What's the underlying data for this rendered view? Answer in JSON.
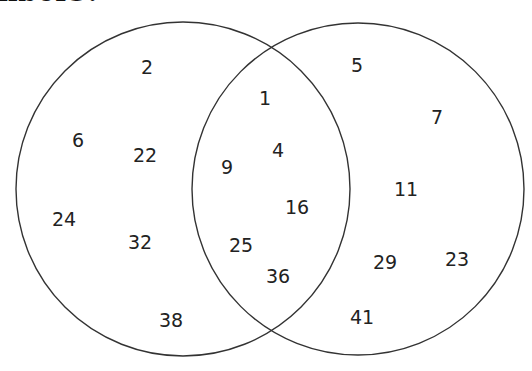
{
  "heading": {
    "text": "nbers?"
  },
  "diagram": {
    "type": "venn",
    "stroke_color": "#333333",
    "circles": [
      {
        "name": "left-set",
        "cx": 183,
        "cy": 189,
        "r": 167
      },
      {
        "name": "right-set",
        "cx": 358,
        "cy": 189,
        "r": 166
      }
    ],
    "regions": {
      "left_only": [
        {
          "value": "2",
          "x": 147,
          "y": 67
        },
        {
          "value": "6",
          "x": 78,
          "y": 140
        },
        {
          "value": "22",
          "x": 145,
          "y": 155
        },
        {
          "value": "24",
          "x": 64,
          "y": 219
        },
        {
          "value": "32",
          "x": 140,
          "y": 242
        },
        {
          "value": "38",
          "x": 171,
          "y": 320
        }
      ],
      "intersection": [
        {
          "value": "1",
          "x": 265,
          "y": 98
        },
        {
          "value": "4",
          "x": 278,
          "y": 150
        },
        {
          "value": "9",
          "x": 227,
          "y": 167
        },
        {
          "value": "16",
          "x": 297,
          "y": 207
        },
        {
          "value": "25",
          "x": 241,
          "y": 245
        },
        {
          "value": "36",
          "x": 278,
          "y": 276
        }
      ],
      "right_only": [
        {
          "value": "5",
          "x": 357,
          "y": 65
        },
        {
          "value": "7",
          "x": 437,
          "y": 117
        },
        {
          "value": "11",
          "x": 406,
          "y": 189
        },
        {
          "value": "29",
          "x": 385,
          "y": 262
        },
        {
          "value": "23",
          "x": 457,
          "y": 259
        },
        {
          "value": "41",
          "x": 362,
          "y": 317
        }
      ]
    }
  }
}
